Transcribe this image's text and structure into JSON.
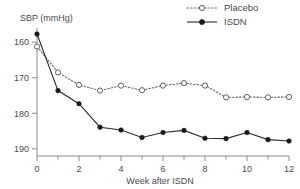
{
  "chart_data": {
    "type": "line",
    "title": "",
    "xlabel": "Week after ISDN",
    "ylabel": "SBP (mmHg)",
    "x": [
      0,
      1,
      2,
      3,
      4,
      5,
      6,
      7,
      8,
      9,
      10,
      11,
      12
    ],
    "xlim": [
      0,
      12
    ],
    "ylim": [
      158,
      194
    ],
    "xticks": [
      0,
      2,
      4,
      6,
      8,
      10,
      12
    ],
    "xticks_minor": [
      1,
      3,
      5,
      7,
      9,
      11
    ],
    "yticks": [
      160,
      170,
      180,
      190
    ],
    "grid": false,
    "legend_position": "top-right",
    "series": [
      {
        "name": "Placebo",
        "marker": "open-circle",
        "linestyle": "dotted",
        "color": "#6d6d6d",
        "values": [
          188.8,
          181.5,
          178.0,
          176.4,
          177.8,
          176.5,
          177.8,
          178.5,
          177.8,
          174.5,
          174.6,
          174.5,
          174.6
        ]
      },
      {
        "name": "ISDN",
        "marker": "filled-circle",
        "linestyle": "solid",
        "color": "#1a1a1a",
        "values": [
          192.3,
          176.4,
          172.7,
          166.1,
          165.3,
          163.2,
          164.6,
          165.2,
          163.0,
          162.9,
          164.6,
          162.6,
          162.2
        ]
      }
    ]
  },
  "axes": {
    "y_title": "SBP (mmHg)",
    "x_title": "Week after ISDN",
    "y_tick_labels": [
      "190",
      "180",
      "170",
      "160"
    ],
    "x_tick_labels": [
      "0",
      "2",
      "4",
      "6",
      "8",
      "10",
      "12"
    ]
  },
  "legend": {
    "items": [
      {
        "label": "Placebo"
      },
      {
        "label": "ISDN"
      }
    ]
  }
}
